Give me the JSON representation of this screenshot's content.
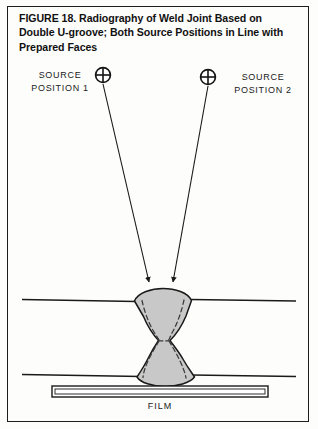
{
  "figure": {
    "caption": "FIGURE 18. Radiography of Weld Joint Based on Double U-groove; Both Source Positions in Line with Prepared Faces",
    "border_color": "#1d1d1d",
    "background_color": "#fdfdfc"
  },
  "sources": [
    {
      "id": "source-position-1",
      "label": "SOURCE\nPOSITION 1",
      "marker_icon": "crosshair-circle-icon",
      "marker_x": 103,
      "marker_y": 75,
      "marker_radius": 7.5
    },
    {
      "id": "source-position-2",
      "label": "SOURCE\nPOSITION 2",
      "marker_icon": "crosshair-circle-icon",
      "marker_x": 208,
      "marker_y": 77,
      "marker_radius": 7.5
    }
  ],
  "rays": [
    {
      "id": "ray-from-source-1",
      "x1": 103,
      "y1": 84,
      "x2": 149,
      "y2": 284,
      "arrowhead": true
    },
    {
      "id": "ray-from-source-2",
      "x1": 208,
      "y1": 86,
      "x2": 173,
      "y2": 284,
      "arrowhead": true
    }
  ],
  "workpiece": {
    "top_surface_line_y": 300,
    "bottom_surface_line_y": 376,
    "plate_line_left_x": 22,
    "plate_line_right_x": 296,
    "line_color": "#1a1a1a",
    "weld_fill_color": "#c8c8c8",
    "weld_outline_color": "#1a1a1a",
    "groove_dash_color": "#3a3a3a",
    "joint_type": "double-U-groove",
    "waist_y": 341
  },
  "film": {
    "label": "FILM",
    "left_x": 52,
    "right_x": 268,
    "top_y": 386,
    "bottom_y": 397,
    "outline_color": "#1a1a1a",
    "fill_color": "#ffffff"
  }
}
